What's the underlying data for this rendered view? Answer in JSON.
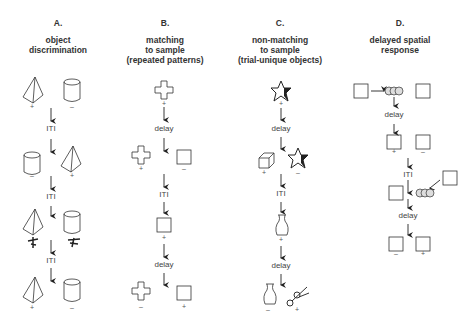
{
  "panels": [
    {
      "letter": "A.",
      "title_lines": [
        "object",
        "discrimination"
      ],
      "steps": [
        "ITI",
        "ITI",
        "ITI"
      ]
    },
    {
      "letter": "B.",
      "title_lines": [
        "matching",
        "to sample",
        "(repeated patterns)"
      ],
      "steps": [
        "delay",
        "ITI",
        "delay"
      ]
    },
    {
      "letter": "C.",
      "title_lines": [
        "non-matching",
        "to sample",
        "(trial-unique objects)"
      ],
      "steps": [
        "delay",
        "ITI",
        "delay"
      ]
    },
    {
      "letter": "D.",
      "title_lines": [
        "delayed spatial",
        "response"
      ],
      "steps": [
        "delay",
        "ITI",
        "delay"
      ]
    }
  ],
  "signs": {
    "plus": "+",
    "minus": "–"
  }
}
